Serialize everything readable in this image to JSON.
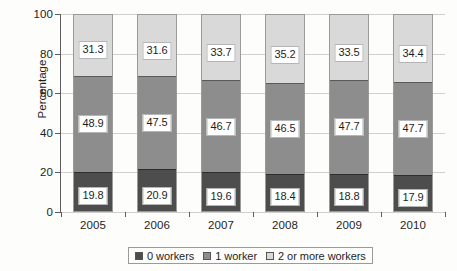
{
  "chart_data": {
    "type": "bar",
    "subtype": "stacked-100-percent",
    "title": "",
    "xlabel": "",
    "ylabel": "Percentage",
    "ylim": [
      0,
      100
    ],
    "yticks": [
      0,
      20,
      40,
      60,
      80,
      100
    ],
    "ytick_labels": [
      "0",
      "20",
      "40",
      "60",
      "80",
      "100"
    ],
    "grid": true,
    "grid_axis": "y",
    "legend_position": "bottom-center",
    "categories": [
      "2005",
      "2006",
      "2007",
      "2008",
      "2009",
      "2010"
    ],
    "series": [
      {
        "name": "0 workers",
        "color": "#4d4d4d",
        "stack_order": 0,
        "values": [
          19.8,
          20.9,
          19.6,
          18.4,
          18.8,
          17.9
        ],
        "labels": [
          "19.8",
          "20.9",
          "19.6",
          "18.4",
          "18.8",
          "17.9"
        ]
      },
      {
        "name": "1 worker",
        "color": "#8d8d8d",
        "stack_order": 1,
        "values": [
          48.9,
          47.5,
          46.7,
          46.5,
          47.7,
          47.7
        ],
        "labels": [
          "48.9",
          "47.5",
          "46.7",
          "46.5",
          "47.7",
          "47.7"
        ]
      },
      {
        "name": "2 or more workers",
        "color": "#d9d9d9",
        "stack_order": 2,
        "values": [
          31.3,
          31.6,
          33.7,
          35.2,
          33.5,
          34.4
        ],
        "labels": [
          "31.3",
          "31.6",
          "33.7",
          "35.2",
          "33.5",
          "34.4"
        ]
      }
    ]
  },
  "axes": {
    "y_title": "Percentage",
    "y_ticks": [
      "100",
      "80",
      "60",
      "40",
      "20",
      "0"
    ],
    "x_ticks": [
      "2005",
      "2006",
      "2007",
      "2008",
      "2009",
      "2010"
    ]
  },
  "legend": {
    "items": [
      {
        "label": "0 workers",
        "color": "#4d4d4d"
      },
      {
        "label": "1 worker",
        "color": "#8d8d8d"
      },
      {
        "label": "2 or more workers",
        "color": "#d9d9d9"
      }
    ]
  }
}
